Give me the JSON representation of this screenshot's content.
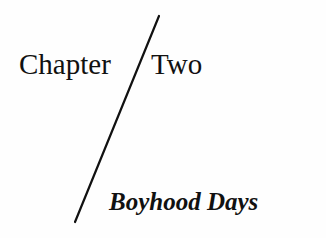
{
  "heading": {
    "chapter_label": "Chapter",
    "chapter_number": "Two",
    "subtitle": "Boyhood Days"
  },
  "divider": {
    "shape": "diagonal-slash-line",
    "color": "#111111"
  }
}
